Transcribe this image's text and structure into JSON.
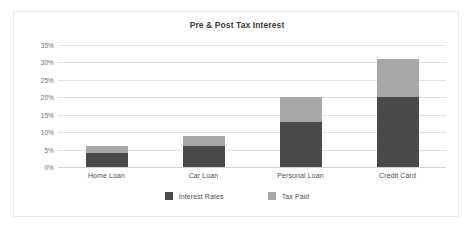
{
  "chart_data": {
    "type": "bar",
    "stacked": true,
    "title": "Pre & Post Tax Interest",
    "xlabel": "",
    "ylabel": "",
    "categories": [
      "Home Loan",
      "Car Loan",
      "Personal Loan",
      "Credit Card"
    ],
    "series": [
      {
        "name": "Interest Rates",
        "color": "#4a4a4a",
        "values": [
          4,
          6,
          13,
          20
        ]
      },
      {
        "name": "Tax Paid",
        "color": "#a8a8a8",
        "values": [
          2,
          3,
          7,
          11
        ]
      }
    ],
    "totals": [
      6,
      9,
      20,
      31
    ],
    "ylim": [
      0,
      35
    ],
    "ytick_values": [
      0,
      5,
      10,
      15,
      20,
      25,
      30,
      35
    ],
    "ytick_labels": [
      "0%",
      "5%",
      "10%",
      "15%",
      "20%",
      "25%",
      "30%",
      "35%"
    ],
    "grid": true,
    "legend_position": "bottom"
  },
  "legend": {
    "items": [
      {
        "label": "Interest Rates",
        "color": "#4a4a4a"
      },
      {
        "label": "Tax Paid",
        "color": "#a8a8a8"
      }
    ]
  }
}
